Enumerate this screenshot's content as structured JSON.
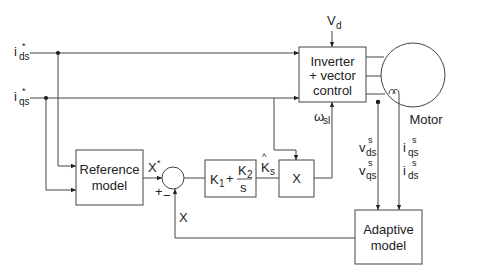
{
  "inputs": {
    "ids": {
      "main": "i",
      "sub": "ds",
      "sup": "*"
    },
    "iqs": {
      "main": "i",
      "sub": "qs",
      "sup": "*"
    }
  },
  "dc_voltage": {
    "main": "V",
    "sub": "d"
  },
  "blocks": {
    "inverter": {
      "line1": "Inverter",
      "line2": "+ vector",
      "line3": "control"
    },
    "motor": {
      "label": "Motor"
    },
    "reference_model": {
      "line1": "Reference",
      "line2": "model"
    },
    "pi_controller": {
      "k1": "K",
      "k1_sub": "1",
      "plus": "+",
      "k2": "K",
      "k2_sub": "2",
      "den": "s"
    },
    "multiplier": {
      "label": "X"
    },
    "adaptive_model": {
      "line1": "Adaptive",
      "line2": "model"
    }
  },
  "signals": {
    "x_star": {
      "main": "X",
      "sup": "*"
    },
    "x_feedback": "X",
    "sum_plus": "+",
    "sum_minus": "−",
    "ks_hat": {
      "hat": "^",
      "main": "K",
      "sub": "s"
    },
    "omega_sl": {
      "main": "ω",
      "sub": "sl"
    },
    "vds": {
      "main": "v",
      "sub": "ds",
      "sup": "s"
    },
    "vqs": {
      "main": "v",
      "sub": "qs",
      "sup": "s"
    },
    "iqs_s": {
      "main": "i",
      "sub": "qs",
      "sup": "s"
    },
    "ids_s": {
      "main": "i",
      "sub": "ds",
      "sup": "s"
    }
  }
}
